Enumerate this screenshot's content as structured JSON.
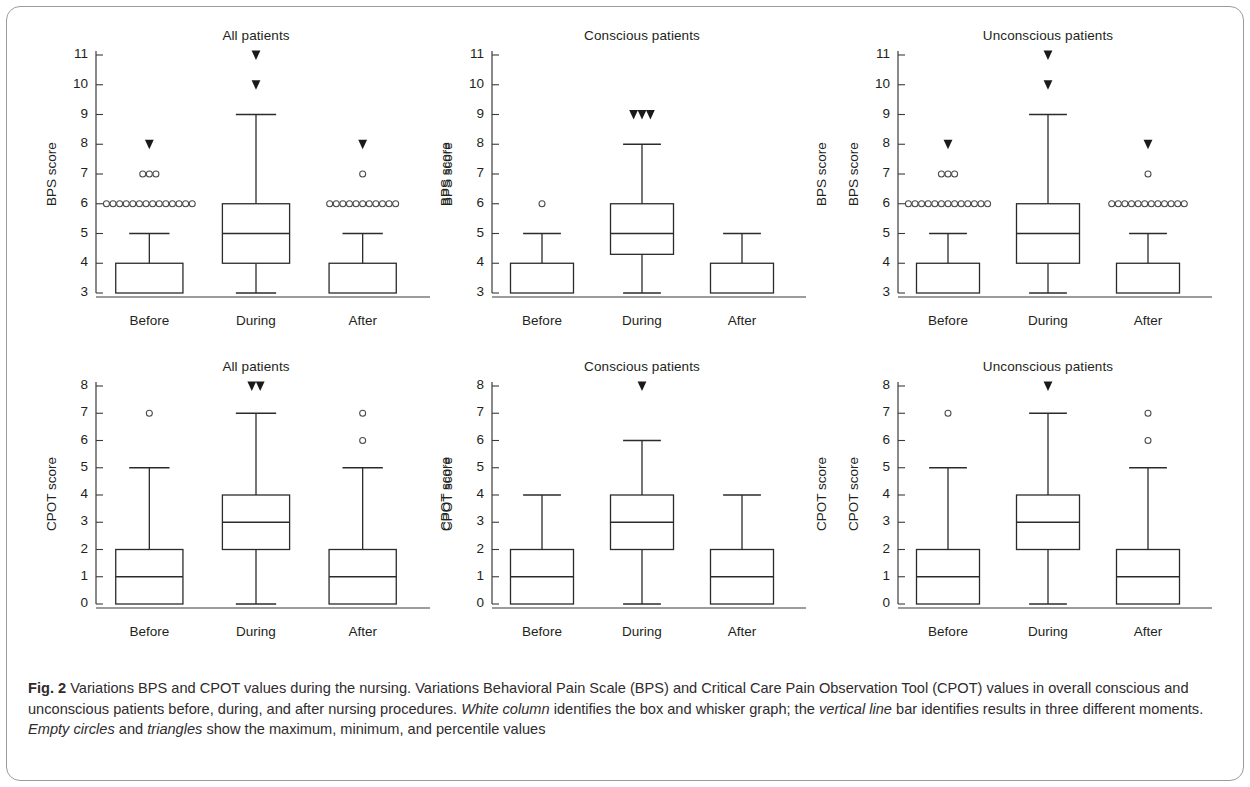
{
  "figure": {
    "label": "Fig. 2",
    "caption_parts": [
      {
        "text": "Fig. 2 ",
        "style": "bold"
      },
      {
        "text": "Variations BPS and CPOT values during the nursing. Variations Behavioral Pain Scale (BPS) and Critical Care Pain Observation Tool (CPOT) values in overall conscious and unconscious patients before, during, and after nursing procedures. ",
        "style": "normal"
      },
      {
        "text": "White column",
        "style": "italic"
      },
      {
        "text": " identifies the box and whisker graph; the ",
        "style": "normal"
      },
      {
        "text": "vertical line",
        "style": "italic"
      },
      {
        "text": " bar identifies results in three different moments. ",
        "style": "normal"
      },
      {
        "text": "Empty circles",
        "style": "italic"
      },
      {
        "text": " and ",
        "style": "normal"
      },
      {
        "text": "triangles",
        "style": "italic"
      },
      {
        "text": " show the maximum, minimum, and percentile values",
        "style": "normal"
      }
    ],
    "caption_text": "Fig. 2 Variations BPS and CPOT values during the nursing. Variations Behavioral Pain Scale (BPS) and Critical Care Pain Observation Tool (CPOT) values in overall conscious and unconscious patients before, during, and after nursing procedures. White column identifies the box and whisker graph; the vertical line bar identifies results in three different moments. Empty circles and triangles show the maximum, minimum, and percentile values"
  },
  "chart_data": [
    {
      "type": "box",
      "panel_id": "bps-all",
      "title": "All patients",
      "ylabel": "BPS score",
      "ylabel_right": "BPS score",
      "xlabel": "",
      "categories": [
        "Before",
        "During",
        "After"
      ],
      "yticks": [
        3,
        4,
        5,
        6,
        7,
        8,
        9,
        10,
        11
      ],
      "ylim": [
        3,
        11
      ],
      "grid": false,
      "boxes": [
        {
          "category": "Before",
          "whisker_low": 3,
          "q1": 3,
          "median": 3,
          "q3": 4,
          "whisker_high": 5,
          "outlier_circles": [
            {
              "value": 7,
              "count": 3
            },
            {
              "value": 6,
              "count": 14
            }
          ],
          "outlier_triangles": [
            {
              "value": 8,
              "count": 1
            }
          ]
        },
        {
          "category": "During",
          "whisker_low": 3,
          "q1": 4,
          "median": 5,
          "q3": 6,
          "whisker_high": 9,
          "outlier_circles": [],
          "outlier_triangles": [
            {
              "value": 11,
              "count": 1
            },
            {
              "value": 10,
              "count": 1
            }
          ]
        },
        {
          "category": "After",
          "whisker_low": 3,
          "q1": 3,
          "median": 3,
          "q3": 4,
          "whisker_high": 5,
          "outlier_circles": [
            {
              "value": 7,
              "count": 1
            },
            {
              "value": 6,
              "count": 11
            }
          ],
          "outlier_triangles": [
            {
              "value": 8,
              "count": 1
            }
          ]
        }
      ]
    },
    {
      "type": "box",
      "panel_id": "bps-conscious",
      "title": "Conscious patients",
      "ylabel": "BPS score",
      "ylabel_right": "BPS score",
      "xlabel": "",
      "categories": [
        "Before",
        "During",
        "After"
      ],
      "yticks": [
        3,
        4,
        5,
        6,
        7,
        8,
        9,
        10,
        11
      ],
      "ylim": [
        3,
        11
      ],
      "grid": false,
      "boxes": [
        {
          "category": "Before",
          "whisker_low": 3,
          "q1": 3,
          "median": 3,
          "q3": 4,
          "whisker_high": 5,
          "outlier_circles": [
            {
              "value": 6,
              "count": 1
            }
          ],
          "outlier_triangles": []
        },
        {
          "category": "During",
          "whisker_low": 3,
          "q1": 4.3,
          "median": 5,
          "q3": 6,
          "whisker_high": 8,
          "outlier_circles": [],
          "outlier_triangles": [
            {
              "value": 9,
              "count": 3
            }
          ]
        },
        {
          "category": "After",
          "whisker_low": 3,
          "q1": 3,
          "median": 3,
          "q3": 4,
          "whisker_high": 5,
          "outlier_circles": [],
          "outlier_triangles": []
        }
      ]
    },
    {
      "type": "box",
      "panel_id": "bps-unconscious",
      "title": "Unconscious patients",
      "ylabel": "BPS score",
      "ylabel_right": "",
      "xlabel": "",
      "categories": [
        "Before",
        "During",
        "After"
      ],
      "yticks": [
        3,
        4,
        5,
        6,
        7,
        8,
        9,
        10,
        11
      ],
      "ylim": [
        3,
        11
      ],
      "grid": false,
      "boxes": [
        {
          "category": "Before",
          "whisker_low": 3,
          "q1": 3,
          "median": 3,
          "q3": 4,
          "whisker_high": 5,
          "outlier_circles": [
            {
              "value": 7,
              "count": 3
            },
            {
              "value": 6,
              "count": 13
            }
          ],
          "outlier_triangles": [
            {
              "value": 8,
              "count": 1
            }
          ]
        },
        {
          "category": "During",
          "whisker_low": 3,
          "q1": 4,
          "median": 5,
          "q3": 6,
          "whisker_high": 9,
          "outlier_circles": [],
          "outlier_triangles": [
            {
              "value": 11,
              "count": 1
            },
            {
              "value": 10,
              "count": 1
            }
          ]
        },
        {
          "category": "After",
          "whisker_low": 3,
          "q1": 3,
          "median": 3,
          "q3": 4,
          "whisker_high": 5,
          "outlier_circles": [
            {
              "value": 7,
              "count": 1
            },
            {
              "value": 6,
              "count": 12
            }
          ],
          "outlier_triangles": [
            {
              "value": 8,
              "count": 1
            }
          ]
        }
      ]
    },
    {
      "type": "box",
      "panel_id": "cpot-all",
      "title": "All patients",
      "ylabel": "CPOT score",
      "ylabel_right": "CPOT score",
      "xlabel": "",
      "categories": [
        "Before",
        "During",
        "After"
      ],
      "yticks": [
        0,
        1,
        2,
        3,
        4,
        5,
        6,
        7,
        8
      ],
      "ylim": [
        0,
        8
      ],
      "grid": false,
      "boxes": [
        {
          "category": "Before",
          "whisker_low": 0,
          "q1": 0,
          "median": 1,
          "q3": 2,
          "whisker_high": 5,
          "outlier_circles": [
            {
              "value": 7,
              "count": 1
            }
          ],
          "outlier_triangles": []
        },
        {
          "category": "During",
          "whisker_low": 0,
          "q1": 2,
          "median": 3,
          "q3": 4,
          "whisker_high": 7,
          "outlier_circles": [],
          "outlier_triangles": [
            {
              "value": 8,
              "count": 2
            }
          ]
        },
        {
          "category": "After",
          "whisker_low": 0,
          "q1": 0,
          "median": 1,
          "q3": 2,
          "whisker_high": 5,
          "outlier_circles": [
            {
              "value": 7,
              "count": 1
            },
            {
              "value": 6,
              "count": 1
            }
          ],
          "outlier_triangles": []
        }
      ]
    },
    {
      "type": "box",
      "panel_id": "cpot-conscious",
      "title": "Conscious patients",
      "ylabel": "CPOT score",
      "ylabel_right": "CPOT score",
      "xlabel": "",
      "categories": [
        "Before",
        "During",
        "After"
      ],
      "yticks": [
        0,
        1,
        2,
        3,
        4,
        5,
        6,
        7,
        8
      ],
      "ylim": [
        0,
        8
      ],
      "grid": false,
      "boxes": [
        {
          "category": "Before",
          "whisker_low": 0,
          "q1": 0,
          "median": 1,
          "q3": 2,
          "whisker_high": 4,
          "outlier_circles": [],
          "outlier_triangles": []
        },
        {
          "category": "During",
          "whisker_low": 0,
          "q1": 2,
          "median": 3,
          "q3": 4,
          "whisker_high": 6,
          "outlier_circles": [],
          "outlier_triangles": [
            {
              "value": 8,
              "count": 1
            }
          ]
        },
        {
          "category": "After",
          "whisker_low": 0,
          "q1": 0,
          "median": 1,
          "q3": 2,
          "whisker_high": 4,
          "outlier_circles": [],
          "outlier_triangles": []
        }
      ]
    },
    {
      "type": "box",
      "panel_id": "cpot-unconscious",
      "title": "Unconscious patients",
      "ylabel": "CPOT score",
      "ylabel_right": "",
      "xlabel": "",
      "categories": [
        "Before",
        "During",
        "After"
      ],
      "yticks": [
        0,
        1,
        2,
        3,
        4,
        5,
        6,
        7,
        8
      ],
      "ylim": [
        0,
        8
      ],
      "grid": false,
      "boxes": [
        {
          "category": "Before",
          "whisker_low": 0,
          "q1": 0,
          "median": 1,
          "q3": 2,
          "whisker_high": 5,
          "outlier_circles": [
            {
              "value": 7,
              "count": 1
            }
          ],
          "outlier_triangles": []
        },
        {
          "category": "During",
          "whisker_low": 0,
          "q1": 2,
          "median": 3,
          "q3": 4,
          "whisker_high": 7,
          "outlier_circles": [],
          "outlier_triangles": [
            {
              "value": 8,
              "count": 1
            }
          ]
        },
        {
          "category": "After",
          "whisker_low": 0,
          "q1": 0,
          "median": 1,
          "q3": 2,
          "whisker_high": 5,
          "outlier_circles": [
            {
              "value": 7,
              "count": 1
            },
            {
              "value": 6,
              "count": 1
            }
          ],
          "outlier_triangles": []
        }
      ]
    }
  ],
  "layout": {
    "panel_geometry": [
      {
        "panel_id": "bps-all",
        "left": 22,
        "top": 28,
        "plot_x": 96,
        "plot_w": 320,
        "plot_top": 55,
        "plot_bottom": 293,
        "right_label": true
      },
      {
        "panel_id": "bps-conscious",
        "left": 440,
        "top": 28,
        "plot_x": 492,
        "plot_w": 300,
        "plot_top": 55,
        "plot_bottom": 293,
        "right_label": true
      },
      {
        "panel_id": "bps-unconscious",
        "left": 840,
        "top": 28,
        "plot_x": 898,
        "plot_w": 300,
        "plot_top": 55,
        "plot_bottom": 293,
        "right_label": false
      },
      {
        "panel_id": "cpot-all",
        "left": 22,
        "top": 358,
        "plot_x": 96,
        "plot_w": 320,
        "plot_top": 386,
        "plot_bottom": 604,
        "right_label": true
      },
      {
        "panel_id": "cpot-conscious",
        "left": 440,
        "top": 358,
        "plot_x": 492,
        "plot_w": 300,
        "plot_top": 386,
        "plot_bottom": 604,
        "right_label": true
      },
      {
        "panel_id": "cpot-unconscious",
        "left": 840,
        "top": 358,
        "plot_x": 898,
        "plot_w": 300,
        "plot_top": 386,
        "plot_bottom": 604,
        "right_label": false
      }
    ],
    "colors": {
      "line": "#2b2b2b",
      "axis": "#3b3b3b",
      "text": "#231f20",
      "caption_text": "#2f2b2c",
      "frame": "#9b9b9b",
      "background": "#ffffff"
    }
  }
}
